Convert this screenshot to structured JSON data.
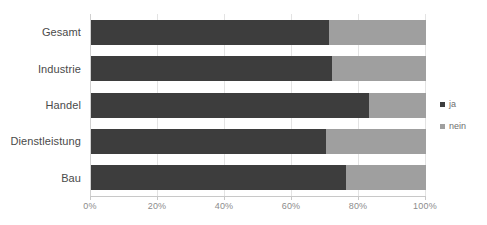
{
  "chart_data": {
    "type": "bar",
    "orientation": "horizontal",
    "stacked": true,
    "normalized": "100%",
    "title": "",
    "subtitle": "",
    "xlabel": "",
    "ylabel": "",
    "xlim": [
      0,
      100
    ],
    "grid": true,
    "legend_position": "right",
    "categories": [
      "Gesamt",
      "Industrie",
      "Handel",
      "Dienstleistung",
      "Bau"
    ],
    "xticks": [
      0,
      20,
      40,
      60,
      80,
      100
    ],
    "xticklabels": [
      "0%",
      "20%",
      "40%",
      "60%",
      "80%",
      "100%"
    ],
    "series": [
      {
        "name": "ja",
        "color": "#3d3d3d",
        "values": [
          71,
          72,
          83,
          70,
          76
        ]
      },
      {
        "name": "nein",
        "color": "#9f9f9f",
        "values": [
          29,
          28,
          17,
          30,
          24
        ]
      }
    ]
  },
  "legend": {
    "items": [
      {
        "label": "ja",
        "marker": "square-marker-dark"
      },
      {
        "label": "nein",
        "marker": "square-marker-gray"
      }
    ]
  },
  "colors": {
    "series_ja": "#3d3d3d",
    "series_nein": "#9f9f9f",
    "gridline": "#e3e3e3",
    "axis": "#c8c8c8",
    "category_text": "#4a4a4a",
    "tick_text": "#8c8c8c",
    "background": "#ffffff"
  }
}
